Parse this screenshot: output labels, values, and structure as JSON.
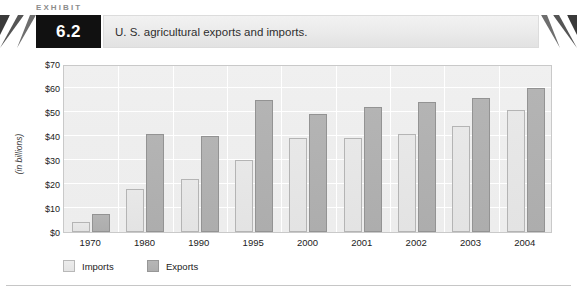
{
  "exhibit": {
    "kicker": "EXHIBIT",
    "number": "6.2",
    "title": "U. S. agricultural exports and imports."
  },
  "chart_data": {
    "type": "bar",
    "title": "U. S. agricultural exports and imports.",
    "xlabel": "",
    "ylabel": "(in billions)",
    "ylim": [
      0,
      70
    ],
    "ytick_values": [
      0,
      10,
      20,
      30,
      40,
      50,
      60,
      70
    ],
    "ytick_labels": [
      "$0",
      "$10",
      "$20",
      "$30",
      "$40",
      "$50",
      "$60",
      "$70"
    ],
    "grid": true,
    "legend_position": "bottom-left",
    "categories": [
      "1970",
      "1980",
      "1990",
      "1995",
      "2000",
      "2001",
      "2002",
      "2003",
      "2004"
    ],
    "series": [
      {
        "name": "Imports",
        "color": "#e6e6e6",
        "values": [
          4,
          18,
          22,
          30,
          39,
          39,
          41,
          44,
          51
        ]
      },
      {
        "name": "Exports",
        "color": "#b2b2b2",
        "values": [
          7.5,
          41,
          40,
          55,
          49,
          52,
          54,
          56,
          60
        ]
      }
    ]
  }
}
